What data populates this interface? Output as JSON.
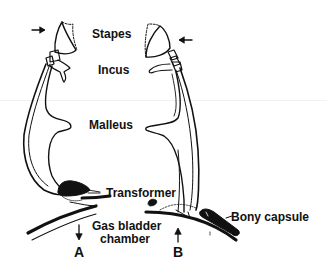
{
  "figure": {
    "labels": {
      "stapes": "Stapes",
      "incus": "Incus",
      "malleus": "Malleus",
      "transformer": "Transformer",
      "gas_bladder_line1": "Gas bladder",
      "gas_bladder_line2": "chamber",
      "bony_capsule": "Bony capsule",
      "panel_a": "A",
      "panel_b": "B"
    },
    "icons": {
      "arrow_a_top": "arrow-right-icon",
      "arrow_b_top": "arrow-left-icon",
      "arrow_a_bottom": "arrow-down-icon",
      "arrow_b_bottom": "arrow-up-icon"
    },
    "colors": {
      "ink": "#111111",
      "background": "#ffffff"
    }
  }
}
